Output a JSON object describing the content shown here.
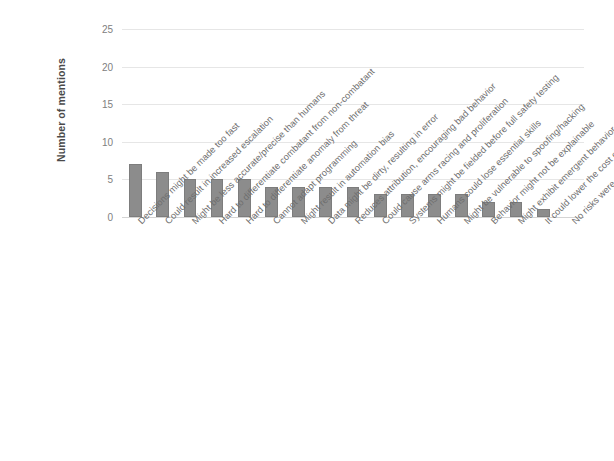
{
  "chart_data": {
    "type": "bar",
    "title": "",
    "subtitle": "",
    "xlabel": "",
    "ylabel": "Number of mentions",
    "ylim": [
      0,
      25
    ],
    "ytick_labels": [
      "0",
      "5",
      "10",
      "15",
      "20",
      "25"
    ],
    "ytick_values": [
      0,
      5,
      10,
      15,
      20,
      25
    ],
    "grid": true,
    "legend": false,
    "bar_color": "#8c8c8c",
    "background_color": "#ffffff",
    "categories": [
      "Decisions might be made too fast",
      "Could result in increased escalation",
      "Might be less accurate/precise than humans",
      "Hard to differentiate combatant from non-combatant",
      "Hard to differentiate anomaly from threat",
      "Cannot adapt programming",
      "Might result in automation bias",
      "Data might be dirty, resulting in error",
      "Reduces attribution, encouraging bad behavior",
      "Could cause arms racing and proliferation",
      "Systems might be fielded before full safety testing",
      "Humans could lose essential skills",
      "Might be vulnerable to spoofing/hacking",
      "Behavior might not be explainable",
      "Might exhibit emergent behavior",
      "It could lower the cost of war",
      "No risks were mentioned"
    ],
    "values": [
      7,
      6,
      5,
      5,
      5,
      4,
      4,
      4,
      4,
      3,
      3,
      3,
      3,
      2,
      2,
      1,
      0
    ]
  }
}
